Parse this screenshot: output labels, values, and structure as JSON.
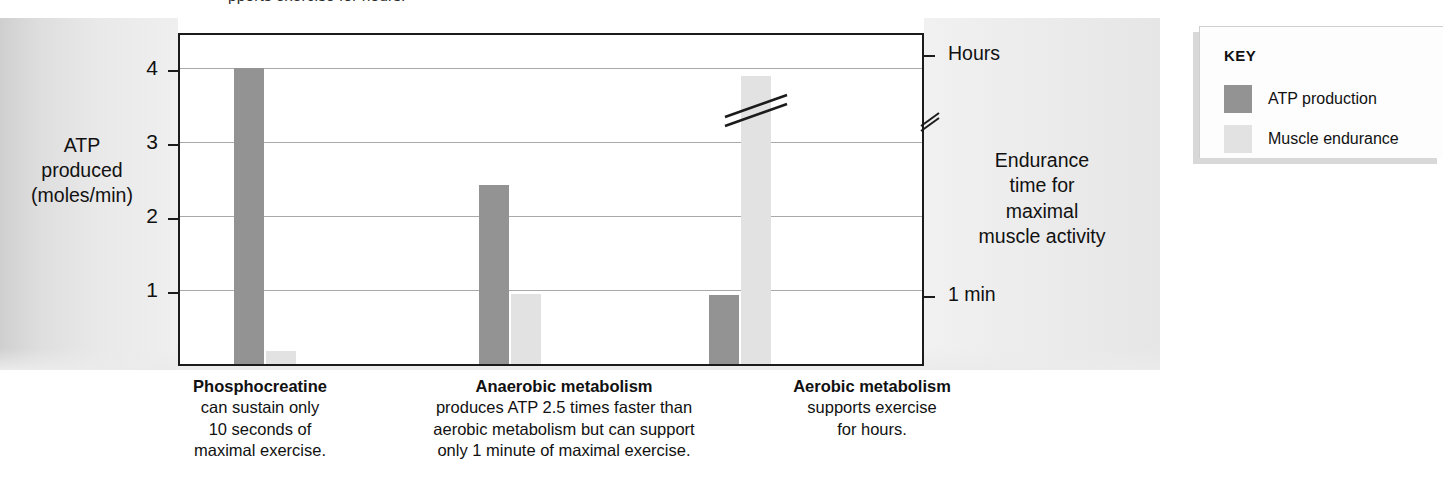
{
  "top_fragment": "pports exercise for hours.",
  "chart_data": {
    "type": "bar",
    "title": "",
    "categories": [
      "Phosphocreatine",
      "Anaerobic metabolism",
      "Aerobic metabolism"
    ],
    "series": [
      {
        "name": "ATP production",
        "color": "#939393",
        "values": [
          4.0,
          2.42,
          0.93
        ]
      },
      {
        "name": "Muscle endurance",
        "color": "#e2e2e2",
        "values": [
          0.18,
          0.95,
          3.9
        ]
      }
    ],
    "ylabel": "ATP produced (moles/min)",
    "ylim": [
      0,
      4.45
    ],
    "yticks": [
      1,
      2,
      3,
      4
    ],
    "ytick_labels": [
      "1",
      "2",
      "3",
      "4"
    ],
    "xlabel": "",
    "right_axis": {
      "label": "Endurance time for maximal muscle activity",
      "ticks": [
        {
          "label": "Hours",
          "value": 4.2
        },
        {
          "label": "1 min",
          "value": 0.95
        }
      ],
      "has_break": true,
      "break_value": 3.7
    },
    "grid": true,
    "legend_position": "right-outside",
    "bar_break_marker": {
      "series": "Muscle endurance",
      "category": "Aerobic metabolism"
    }
  },
  "y_axis": {
    "title_lines": [
      "ATP",
      "produced",
      "(moles/min)"
    ],
    "ticks": [
      "4",
      "3",
      "2",
      "1"
    ]
  },
  "right_axis": {
    "top_tick_label": "Hours",
    "bottom_tick_label": "1 min",
    "title_lines": [
      "Endurance",
      "time for",
      "maximal",
      "muscle activity"
    ]
  },
  "captions": [
    {
      "heading": "Phosphocreatine",
      "lines": [
        "can sustain only",
        "10 seconds of",
        "maximal exercise."
      ]
    },
    {
      "heading": "Anaerobic metabolism",
      "lines": [
        "produces ATP 2.5 times faster than",
        "aerobic metabolism but can support",
        "only 1 minute of maximal exercise."
      ]
    },
    {
      "heading": "Aerobic metabolism",
      "lines": [
        "supports exercise",
        "for hours."
      ]
    }
  ],
  "key": {
    "title": "KEY",
    "items": [
      {
        "label": "ATP production",
        "color": "#939393"
      },
      {
        "label": "Muscle endurance",
        "color": "#e2e2e2"
      }
    ]
  }
}
